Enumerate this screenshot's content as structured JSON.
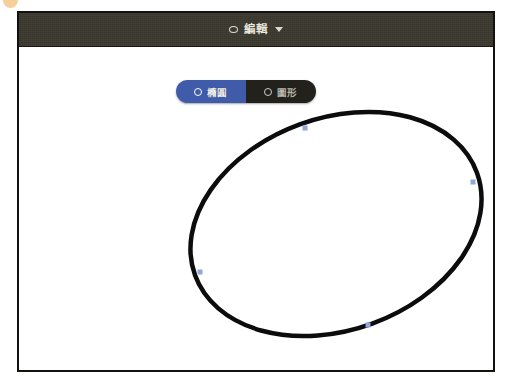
{
  "window": {
    "title_bar": {
      "menu_label": "編輯",
      "icon": "ellipse-outline-icon",
      "dropdown_icon": "chevron-down-icon",
      "background_color": "#3b392f",
      "text_color": "#e9e6dc"
    },
    "border_color": "#14120f",
    "canvas_background": "#ffffff"
  },
  "segmented_control": {
    "name": "shape-mode-segmented",
    "selected_index": 0,
    "selected_color": "#3f5ba9",
    "unselected_color": "#23211b",
    "options": [
      {
        "label": "橢圓",
        "icon": "ellipse-outline-icon",
        "selected": true
      },
      {
        "label": "圖形",
        "icon": "ellipse-outline-icon",
        "selected": false
      }
    ]
  },
  "canvas": {
    "shape": {
      "type": "ellipse",
      "stroke_color": "#0c0c0c",
      "stroke_width": 4.5,
      "fill": "none",
      "center_x": 336,
      "center_y": 223,
      "radius_x": 150,
      "radius_y": 106,
      "rotation_degrees": -20
    },
    "handles": {
      "color": "#8fa8d8",
      "size": 5,
      "points": [
        {
          "name": "handle-top",
          "x": 305,
          "y": 127
        },
        {
          "name": "handle-right",
          "x": 473,
          "y": 181
        },
        {
          "name": "handle-bottom",
          "x": 368,
          "y": 324
        },
        {
          "name": "handle-left",
          "x": 200,
          "y": 271
        }
      ]
    }
  },
  "corner_fragment": {
    "name": "cropped-icon-fragment",
    "color": "#f0a848"
  }
}
